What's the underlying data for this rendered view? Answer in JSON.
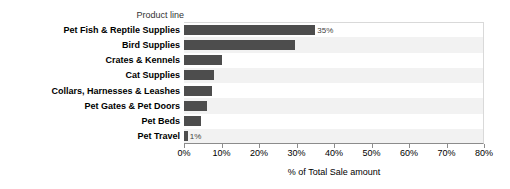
{
  "chart_data": {
    "type": "bar",
    "orientation": "horizontal",
    "title": "",
    "field_header": "Product line",
    "xlabel": "% of Total Sale amount",
    "ylabel": "",
    "xlim": [
      0,
      80
    ],
    "xticks": [
      "0%",
      "10%",
      "20%",
      "30%",
      "40%",
      "50%",
      "60%",
      "70%",
      "80%"
    ],
    "xtick_values": [
      0,
      10,
      20,
      30,
      40,
      50,
      60,
      70,
      80
    ],
    "grid": false,
    "legend": "none",
    "bar_color": "#4d4d4d",
    "band_color": "#f2f2f2",
    "categories": [
      "Pet Fish & Reptile Supplies",
      "Bird Supplies",
      "Crates & Kennels",
      "Cat Supplies",
      "Collars, Harnesses & Leashes",
      "Pet Gates & Pet Doors",
      "Pet Beds",
      "Pet Travel"
    ],
    "values": [
      35,
      29.5,
      10,
      8,
      7.5,
      6,
      4.5,
      1
    ],
    "point_labels": [
      "35%",
      "",
      "",
      "",
      "",
      "",
      "",
      "1%"
    ]
  }
}
